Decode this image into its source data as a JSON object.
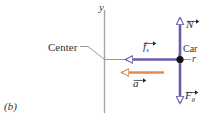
{
  "figure": {
    "panel_label": "(b)",
    "background_color": "#ffffff"
  },
  "axes": {
    "y_axis_label": "y",
    "radius_label": "r",
    "axis_color": "#9a9a9a"
  },
  "annotations": {
    "center_label": "Center",
    "car_label": "Car",
    "leader_color": "#777777"
  },
  "vectors": [
    {
      "name": "normal-force",
      "symbol": "N",
      "subscript": "",
      "direction": "up",
      "color": "#6b5bab"
    },
    {
      "name": "static-friction-force",
      "symbol": "f",
      "subscript": "s",
      "direction": "left",
      "color": "#6b5bab"
    },
    {
      "name": "acceleration",
      "symbol": "a",
      "subscript": "",
      "direction": "left",
      "color": "#e08a53"
    },
    {
      "name": "gravitational-force",
      "symbol": "F",
      "subscript": "g",
      "direction": "down",
      "color": "#6b5bab"
    }
  ],
  "point": {
    "name": "car-position-dot",
    "color": "#111111"
  }
}
